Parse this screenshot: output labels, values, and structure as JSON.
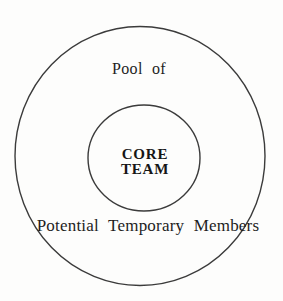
{
  "diagram": {
    "outer_circle": {
      "label_top": "Pool of",
      "label_bottom": "Potential Temporary Members"
    },
    "inner_circle": {
      "label_line1": "CORE",
      "label_line2": "TEAM"
    },
    "colors": {
      "background": "#fdfdfc",
      "line": "#3b3b3b",
      "text": "#1e1e1e"
    }
  }
}
